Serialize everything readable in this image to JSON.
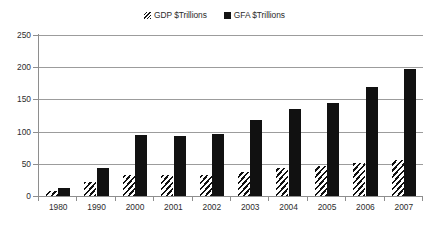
{
  "chart_data": {
    "type": "bar",
    "title": "",
    "subtitle": "",
    "xlabel": "",
    "ylabel": "",
    "categories": [
      "1980",
      "1990",
      "2000",
      "2001",
      "2002",
      "2003",
      "2004",
      "2005",
      "2006",
      "2007"
    ],
    "series": [
      {
        "name": "GDP $Trillions",
        "marker": "hatched-square",
        "color": "#111111",
        "pattern": "diagonal-hatch",
        "values": [
          8,
          22,
          33,
          33,
          33,
          37,
          43,
          46,
          51,
          56
        ]
      },
      {
        "name": "GFA $Trillions",
        "marker": "solid-square",
        "color": "#111111",
        "pattern": "solid",
        "values": [
          12,
          44,
          94,
          93,
          97,
          118,
          135,
          144,
          169,
          198
        ]
      }
    ],
    "ylim": [
      0,
      250
    ],
    "yticks": [
      0,
      50,
      100,
      150,
      200,
      250
    ],
    "ytick_labels": [
      "0",
      "50",
      "100",
      "150",
      "200",
      "250"
    ],
    "grid": true,
    "grid_axis": "y",
    "legend_position": "top-center",
    "annotations": []
  },
  "legend": {
    "entries": [
      {
        "label": "GDP $Trillions",
        "icon": "hatched-square-swatch"
      },
      {
        "label": "GFA $Trillions",
        "icon": "solid-square-swatch"
      }
    ]
  },
  "colors": {
    "series_ink": "#111111",
    "grid": "#9c9c9c",
    "axis": "#8e8e8e",
    "text": "#2d2d2d",
    "background": "#ffffff"
  }
}
